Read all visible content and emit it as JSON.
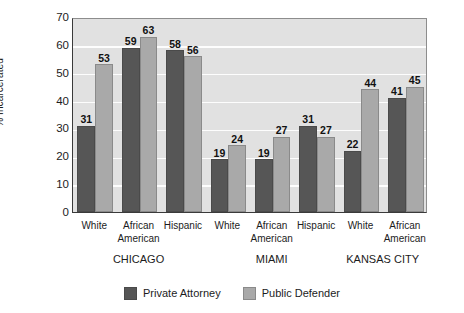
{
  "chart_data": {
    "type": "bar",
    "title": "",
    "xlabel": "",
    "ylabel": "% Incarcerated",
    "ylim": [
      0,
      70
    ],
    "ytick_step": 10,
    "yticks": [
      "0",
      "10",
      "20",
      "30",
      "40",
      "50",
      "60",
      "70"
    ],
    "grid": true,
    "legend_position": "bottom-center",
    "categories": [
      "White",
      "African American",
      "Hispanic",
      "White",
      "African American",
      "Hispanic",
      "White",
      "African American"
    ],
    "category_lines": [
      [
        "White",
        ""
      ],
      [
        "African",
        "American"
      ],
      [
        "Hispanic",
        ""
      ],
      [
        "White",
        ""
      ],
      [
        "African",
        "American"
      ],
      [
        "Hispanic",
        ""
      ],
      [
        "White",
        ""
      ],
      [
        "African",
        "American"
      ]
    ],
    "groups": [
      {
        "label": "CHICAGO",
        "category_indices": [
          0,
          1,
          2
        ]
      },
      {
        "label": "MIAMI",
        "category_indices": [
          3,
          4,
          5
        ]
      },
      {
        "label": "KANSAS CITY",
        "category_indices": [
          6,
          7
        ]
      }
    ],
    "series": [
      {
        "name": "Private Attorney",
        "color": "#565656",
        "values": [
          31,
          59,
          58,
          19,
          19,
          31,
          22,
          41
        ]
      },
      {
        "name": "Public Defender",
        "color": "#a9a9a9",
        "values": [
          53,
          63,
          56,
          24,
          27,
          27,
          44,
          45
        ]
      }
    ]
  },
  "legend": {
    "items": [
      {
        "label": "Private Attorney",
        "swatch": "private"
      },
      {
        "label": "Public Defender",
        "swatch": "public"
      }
    ]
  },
  "colors": {
    "private_attorney": "#565656",
    "public_defender": "#a9a9a9",
    "plot_background": "#e1e1e1",
    "gridline": "#fdfdfd",
    "axis": "#3a3a3a"
  }
}
